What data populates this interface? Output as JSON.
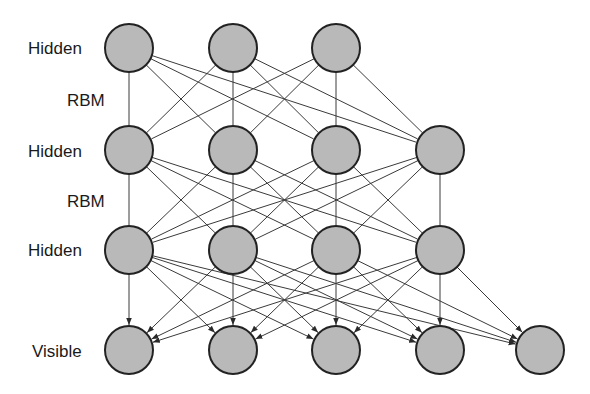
{
  "diagram": {
    "colors": {
      "node_fill": "#b9b9b9",
      "node_stroke": "#222222",
      "edge": "#3a3a3a",
      "text": "#1a1a1a",
      "background": "#ffffff"
    },
    "node_radius": 24,
    "columns_x": [
      129,
      233,
      336,
      440,
      540
    ],
    "layers": [
      {
        "id": "h3",
        "label": "Hidden",
        "y": 48,
        "columns": [
          0,
          1,
          2
        ]
      },
      {
        "id": "h2",
        "label": "Hidden",
        "y": 150,
        "columns": [
          0,
          1,
          2,
          3
        ]
      },
      {
        "id": "h1",
        "label": "Hidden",
        "y": 250,
        "columns": [
          0,
          1,
          2,
          3
        ]
      },
      {
        "id": "v",
        "label": "Visible",
        "y": 350,
        "columns": [
          0,
          1,
          2,
          3,
          4
        ]
      }
    ],
    "connections": [
      {
        "from": "h3",
        "to": "h2",
        "type": "undirected",
        "label": "RBM",
        "pattern": "fully-connected"
      },
      {
        "from": "h2",
        "to": "h1",
        "type": "undirected",
        "label": "RBM",
        "pattern": "fully-connected"
      },
      {
        "from": "h1",
        "to": "v",
        "type": "directed",
        "label": "",
        "pattern": "fully-connected"
      }
    ],
    "labels": {
      "hidden_top": "Hidden",
      "rbm_1": "RBM",
      "hidden_mid": "Hidden",
      "rbm_2": "RBM",
      "hidden_bottom": "Hidden",
      "visible": "Visible"
    }
  }
}
